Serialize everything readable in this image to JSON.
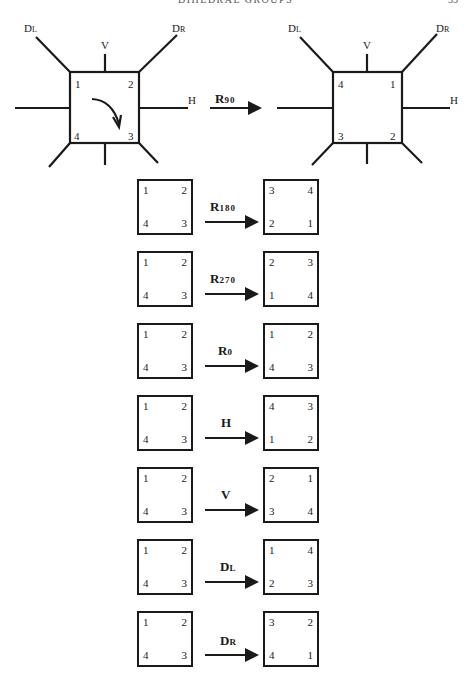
{
  "header": {
    "running_head": "DIHEDRAL GROUPS",
    "page_number": "33"
  },
  "main_figure": {
    "before": {
      "corners": {
        "tl": "1",
        "tr": "2",
        "br": "3",
        "bl": "4"
      },
      "axes": {
        "dl": {
          "main": "D",
          "sub": "L"
        },
        "dr": {
          "main": "D",
          "sub": "R"
        },
        "v": "V",
        "h": "H"
      },
      "rotation_arrow": "clockwise-curved-arrow"
    },
    "operation": {
      "main": "R",
      "sub": "90"
    },
    "after": {
      "corners": {
        "tl": "4",
        "tr": "1",
        "br": "2",
        "bl": "3"
      },
      "axes": {
        "dl": {
          "main": "D",
          "sub": "L"
        },
        "dr": {
          "main": "D",
          "sub": "R"
        },
        "v": "V",
        "h": "H"
      }
    }
  },
  "transformations": [
    {
      "op_main": "R",
      "op_sub": "180",
      "before": {
        "tl": "1",
        "tr": "2",
        "bl": "4",
        "br": "3"
      },
      "after": {
        "tl": "3",
        "tr": "4",
        "bl": "2",
        "br": "1"
      }
    },
    {
      "op_main": "R",
      "op_sub": "270",
      "before": {
        "tl": "1",
        "tr": "2",
        "bl": "4",
        "br": "3"
      },
      "after": {
        "tl": "2",
        "tr": "3",
        "bl": "1",
        "br": "4"
      }
    },
    {
      "op_main": "R",
      "op_sub": "0",
      "before": {
        "tl": "1",
        "tr": "2",
        "bl": "4",
        "br": "3"
      },
      "after": {
        "tl": "1",
        "tr": "2",
        "bl": "4",
        "br": "3"
      }
    },
    {
      "op_main": "H",
      "op_sub": "",
      "before": {
        "tl": "1",
        "tr": "2",
        "bl": "4",
        "br": "3"
      },
      "after": {
        "tl": "4",
        "tr": "3",
        "bl": "1",
        "br": "2"
      }
    },
    {
      "op_main": "V",
      "op_sub": "",
      "before": {
        "tl": "1",
        "tr": "2",
        "bl": "4",
        "br": "3"
      },
      "after": {
        "tl": "2",
        "tr": "1",
        "bl": "3",
        "br": "4"
      }
    },
    {
      "op_main": "D",
      "op_sub": "L",
      "before": {
        "tl": "1",
        "tr": "2",
        "bl": "4",
        "br": "3"
      },
      "after": {
        "tl": "1",
        "tr": "4",
        "bl": "2",
        "br": "3"
      }
    },
    {
      "op_main": "D",
      "op_sub": "R",
      "before": {
        "tl": "1",
        "tr": "2",
        "bl": "4",
        "br": "3"
      },
      "after": {
        "tl": "3",
        "tr": "2",
        "bl": "4",
        "br": "1"
      }
    }
  ]
}
